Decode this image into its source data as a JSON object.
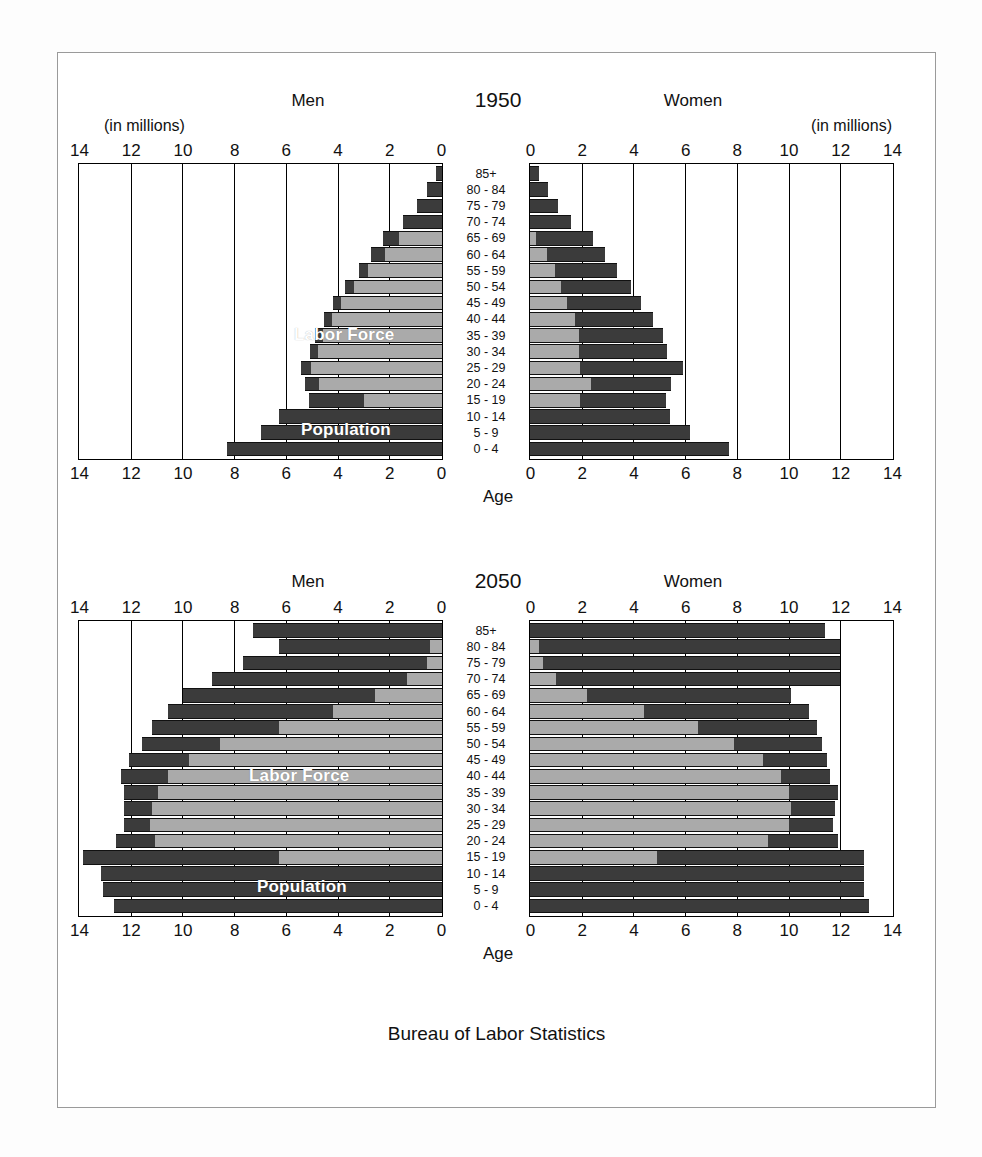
{
  "poster": {
    "source_note": "Bureau of Labor Statistics",
    "age_axis_caption": "Age",
    "units_label": "(in millions)",
    "men_label": "Men",
    "women_label": "Women",
    "series_labels": {
      "population": "Population",
      "labor_force": "Labor Force"
    },
    "colors": {
      "population": "#3b3b3b",
      "labor_force": "#aaaaaa",
      "frame": "#000000",
      "background": "#ffffff"
    }
  },
  "chart_data": [
    {
      "type": "bar",
      "subtype": "population-pyramid",
      "title": "1950",
      "xlabel": "(in millions)",
      "ylabel": "Age",
      "xlim": [
        0,
        14
      ],
      "xticks": [
        14,
        12,
        10,
        8,
        6,
        4,
        2,
        0
      ],
      "xticks_right": [
        0,
        2,
        4,
        6,
        8,
        10,
        12,
        14
      ],
      "grid": true,
      "legend": [
        "Population",
        "Labor Force"
      ],
      "categories": [
        "85+",
        "80 - 84",
        "75 - 79",
        "70 - 74",
        "65 - 69",
        "60 - 64",
        "55 - 59",
        "50 - 54",
        "45 - 49",
        "40 - 44",
        "35 - 39",
        "30 - 34",
        "25 - 29",
        "20 - 24",
        "15 - 19",
        "10 - 14",
        "5 - 9",
        "0 - 4"
      ],
      "series": [
        {
          "name": "Men Population",
          "side": "left",
          "values": [
            0.25,
            0.6,
            0.95,
            1.5,
            2.3,
            2.75,
            3.2,
            3.75,
            4.2,
            4.55,
            4.9,
            5.1,
            5.45,
            5.3,
            5.15,
            6.3,
            7.0,
            8.3
          ]
        },
        {
          "name": "Men Labor Force",
          "side": "left",
          "values": [
            0.0,
            0.0,
            0.0,
            0.0,
            1.65,
            2.2,
            2.85,
            3.4,
            3.9,
            4.25,
            4.6,
            4.8,
            5.05,
            4.75,
            3.0,
            0.0,
            0.0,
            0.0
          ]
        },
        {
          "name": "Women Population",
          "side": "right",
          "values": [
            0.35,
            0.7,
            1.1,
            1.6,
            2.45,
            2.9,
            3.35,
            3.9,
            4.3,
            4.75,
            5.15,
            5.3,
            5.9,
            5.45,
            5.25,
            5.4,
            6.2,
            7.7
          ]
        },
        {
          "name": "Women Labor Force",
          "side": "right",
          "values": [
            0.0,
            0.0,
            0.0,
            0.0,
            0.25,
            0.65,
            0.95,
            1.2,
            1.45,
            1.75,
            1.9,
            1.9,
            1.95,
            2.35,
            1.95,
            0.0,
            0.0,
            0.0
          ]
        }
      ]
    },
    {
      "type": "bar",
      "subtype": "population-pyramid",
      "title": "2050",
      "xlabel": "(in millions)",
      "ylabel": "Age",
      "xlim": [
        0,
        14
      ],
      "xticks": [
        14,
        12,
        10,
        8,
        6,
        4,
        2,
        0
      ],
      "xticks_right": [
        0,
        2,
        4,
        6,
        8,
        10,
        12,
        14
      ],
      "grid": true,
      "legend": [
        "Population",
        "Labor Force"
      ],
      "categories": [
        "85+",
        "80 - 84",
        "75 - 79",
        "70 - 74",
        "65 - 69",
        "60 - 64",
        "55 - 59",
        "50 - 54",
        "45 - 49",
        "40 - 44",
        "35 - 39",
        "30 - 34",
        "25 - 29",
        "20 - 24",
        "15 - 19",
        "10 - 14",
        "5 - 9",
        "0 - 4"
      ],
      "series": [
        {
          "name": "Men Population",
          "side": "left",
          "values": [
            7.3,
            6.3,
            7.7,
            8.9,
            10.0,
            10.6,
            11.2,
            11.6,
            12.1,
            12.4,
            12.3,
            12.3,
            12.3,
            12.6,
            13.9,
            13.2,
            13.1,
            12.7
          ]
        },
        {
          "name": "Men Labor Force",
          "side": "left",
          "values": [
            0.0,
            0.45,
            0.6,
            1.35,
            2.6,
            4.2,
            6.3,
            8.6,
            9.8,
            10.6,
            11.0,
            11.2,
            11.3,
            11.1,
            6.3,
            0.0,
            0.0,
            0.0
          ]
        },
        {
          "name": "Women Population",
          "side": "right",
          "values": [
            11.4,
            12.0,
            12.0,
            12.0,
            10.1,
            10.8,
            11.1,
            11.3,
            11.5,
            11.6,
            11.9,
            11.8,
            11.7,
            11.9,
            12.9,
            12.9,
            12.9,
            13.1
          ]
        },
        {
          "name": "Women Labor Force",
          "side": "right",
          "values": [
            0.0,
            0.35,
            0.5,
            1.0,
            2.2,
            4.4,
            6.5,
            7.9,
            9.0,
            9.7,
            10.0,
            10.1,
            10.0,
            9.2,
            4.9,
            0.0,
            0.0,
            0.0
          ]
        }
      ]
    }
  ]
}
